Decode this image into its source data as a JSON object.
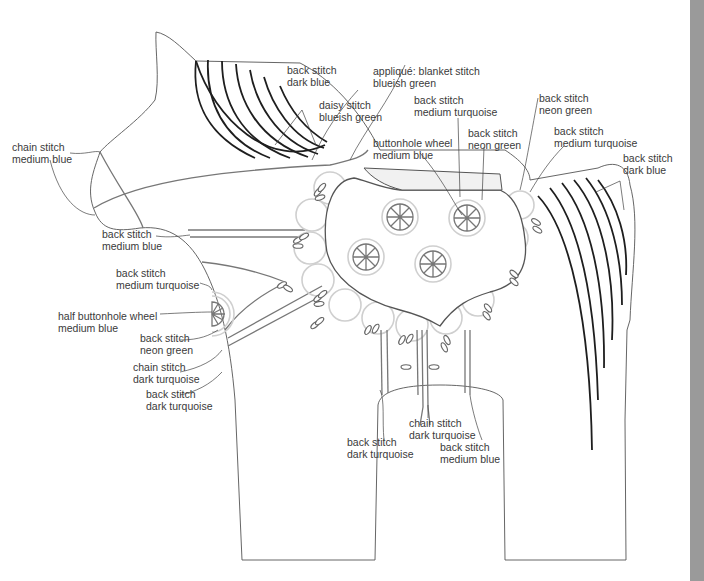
{
  "diagram": {
    "colors": {
      "outline": "#555555",
      "dark_stitch": "#1e1e1e",
      "medium_stitch": "#777777",
      "light_stitch": "#cfcfcf",
      "page_edge": "#9a9a9a",
      "text": "#3a3a3a"
    },
    "labels": [
      {
        "id": "head-stripes",
        "line1": "back stitch",
        "line2": "dark blue"
      },
      {
        "id": "head-daisy",
        "line1": "daisy stitch",
        "line2": "blueish green"
      },
      {
        "id": "applique",
        "line1": "appliqué: blanket stitch",
        "line2": "blueish green"
      },
      {
        "id": "nose",
        "line1": "chain stitch",
        "line2": "medium blue"
      },
      {
        "id": "saddle-turquoise",
        "line1": "back stitch",
        "line2": "medium turquoise"
      },
      {
        "id": "saddle-neon",
        "line1": "back stitch",
        "line2": "neon green"
      },
      {
        "id": "wheel",
        "line1": "buttonhole wheel",
        "line2": "medium blue"
      },
      {
        "id": "back-neon",
        "line1": "back stitch",
        "line2": "neon green"
      },
      {
        "id": "back-turquoise",
        "line1": "back stitch",
        "line2": "medium turquoise"
      },
      {
        "id": "tail",
        "line1": "back stitch",
        "line2": "dark blue"
      },
      {
        "id": "chest-blue",
        "line1": "back stitch",
        "line2": "medium blue"
      },
      {
        "id": "chest-turquoise",
        "line1": "back stitch",
        "line2": "medium turquoise"
      },
      {
        "id": "half-wheel",
        "line1": "half buttonhole wheel",
        "line2": "medium blue"
      },
      {
        "id": "chest-neon",
        "line1": "back stitch",
        "line2": "neon green"
      },
      {
        "id": "chest-chain",
        "line1": "chain stitch",
        "line2": "dark turquoise"
      },
      {
        "id": "chest-dark-turquoise",
        "line1": "back stitch",
        "line2": "dark turquoise"
      },
      {
        "id": "belly-chain",
        "line1": "chain stitch",
        "line2": "dark turquoise"
      },
      {
        "id": "belly-dark-turquoise",
        "line1": "back stitch",
        "line2": "dark turquoise"
      },
      {
        "id": "belly-blue",
        "line1": "back stitch",
        "line2": "medium blue"
      }
    ]
  }
}
